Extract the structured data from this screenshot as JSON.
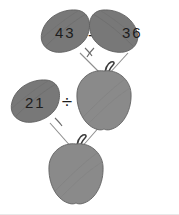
{
  "canvas": {
    "width": 179,
    "height": 215,
    "background_color": "#ffffff",
    "border_color": "#e8e8e8"
  },
  "palette": {
    "leaf_fill": "#787878",
    "leaf_stroke": "#5f5f5f",
    "apple_fill": "#8a8a8a",
    "apple_stroke": "#616161",
    "branch_color": "#8d8d8d",
    "stem_color": "#3c3c3c",
    "text_color": "#1d1d1d"
  },
  "diagram": {
    "type": "apple-tree-math-diagram",
    "leaves": [
      {
        "id": "leaf-43",
        "label": "43",
        "tilt": "left"
      },
      {
        "id": "leaf-36",
        "label": "36",
        "tilt": "right"
      },
      {
        "id": "leaf-21",
        "label": "21",
        "tilt": "left"
      }
    ],
    "operators": [
      {
        "id": "operator-minus",
        "symbol": "–",
        "name": "minus"
      },
      {
        "id": "operator-divide",
        "symbol": "÷",
        "name": "divide"
      }
    ],
    "apples": [
      {
        "id": "apple-middle",
        "label": ""
      },
      {
        "id": "apple-bottom",
        "label": ""
      }
    ]
  }
}
